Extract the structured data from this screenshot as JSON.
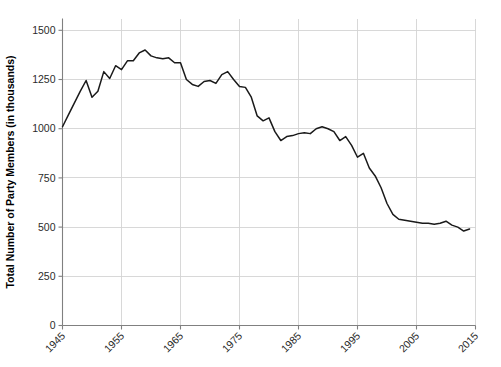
{
  "chart_data": {
    "type": "line",
    "title": "",
    "subtitle": "",
    "xlabel": "",
    "ylabel": "Total Number of Party Members (in thousands)",
    "xlim": [
      1945,
      2015
    ],
    "ylim": [
      0,
      1560
    ],
    "grid": true,
    "legend": false,
    "legend_position": "none",
    "line_color": "#1a1a1a",
    "grid_color": "#d4d4d4",
    "axis_color": "#808080",
    "x_ticks": [
      1945,
      1955,
      1965,
      1975,
      1985,
      1995,
      2005,
      2015
    ],
    "x_tick_labels": [
      "1945",
      "1955",
      "1965",
      "1975",
      "1985",
      "1995",
      "2005",
      "2015"
    ],
    "y_ticks": [
      0,
      250,
      500,
      750,
      1000,
      1250,
      1500
    ],
    "y_tick_labels": [
      "0",
      "250",
      "500",
      "750",
      "1000",
      "1250",
      "1500"
    ],
    "series": [
      {
        "name": "Total Party Members",
        "x": [
          1945,
          1946,
          1947,
          1948,
          1949,
          1950,
          1951,
          1952,
          1953,
          1954,
          1955,
          1956,
          1957,
          1958,
          1959,
          1960,
          1961,
          1962,
          1963,
          1964,
          1965,
          1966,
          1967,
          1968,
          1969,
          1970,
          1971,
          1972,
          1973,
          1974,
          1975,
          1976,
          1977,
          1978,
          1979,
          1980,
          1981,
          1982,
          1983,
          1984,
          1985,
          1986,
          1987,
          1988,
          1989,
          1990,
          1991,
          1992,
          1993,
          1994,
          1995,
          1996,
          1997,
          1998,
          1999,
          2000,
          2001,
          2002,
          2003,
          2004,
          2005,
          2006,
          2007,
          2008,
          2009,
          2010,
          2011,
          2012,
          2013,
          2014
        ],
        "values": [
          1010,
          1070,
          1130,
          1190,
          1245,
          1160,
          1190,
          1290,
          1255,
          1320,
          1300,
          1345,
          1345,
          1385,
          1400,
          1370,
          1360,
          1355,
          1360,
          1335,
          1335,
          1250,
          1225,
          1215,
          1240,
          1245,
          1230,
          1275,
          1290,
          1250,
          1215,
          1210,
          1160,
          1065,
          1040,
          1055,
          985,
          940,
          960,
          965,
          975,
          980,
          975,
          1000,
          1010,
          1000,
          985,
          940,
          960,
          915,
          855,
          875,
          800,
          760,
          700,
          620,
          565,
          540,
          535,
          530,
          525,
          520,
          520,
          515,
          520,
          530,
          510,
          500,
          480,
          490
        ]
      }
    ],
    "annotations": []
  }
}
